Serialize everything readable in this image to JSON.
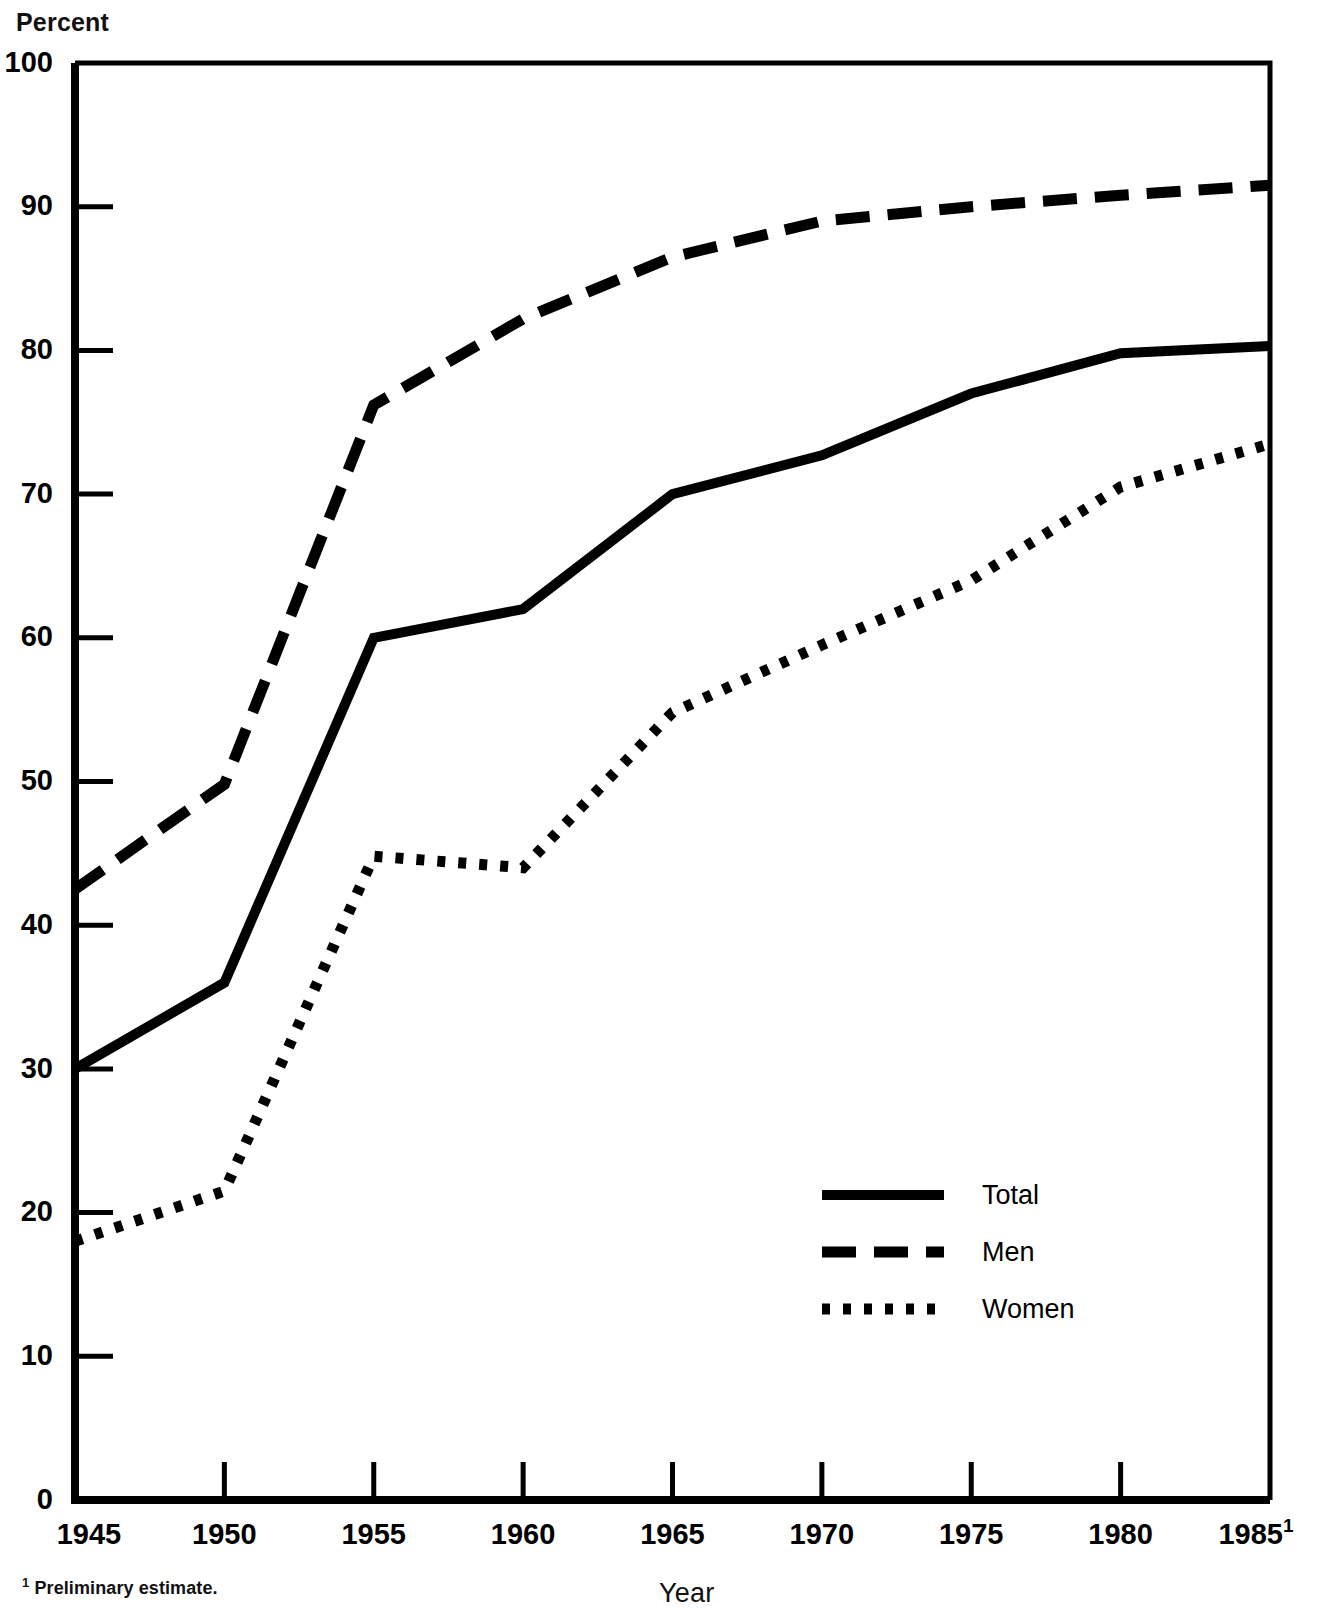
{
  "axes": {
    "ylabel": "Percent",
    "xlabel": "Year",
    "y_ticks": [
      "0",
      "10",
      "20",
      "30",
      "40",
      "50",
      "60",
      "70",
      "80",
      "90",
      "100"
    ],
    "x_ticks": [
      "1945",
      "1950",
      "1955",
      "1960",
      "1965",
      "1970",
      "1975",
      "1980",
      "1985"
    ],
    "x_last_superscript": "1"
  },
  "footnote": {
    "marker": "1",
    "text": " Preliminary estimate."
  },
  "legend": {
    "items": [
      {
        "label": "Total",
        "style": "solid"
      },
      {
        "label": "Men",
        "style": "dashed"
      },
      {
        "label": "Women",
        "style": "dotted"
      }
    ]
  },
  "colors": {
    "line": "#000000",
    "axis": "#000000",
    "background": "#ffffff"
  },
  "chart_data": {
    "type": "line",
    "title": "",
    "xlabel": "Year",
    "ylabel": "Percent",
    "xlim": [
      1945,
      1985
    ],
    "ylim": [
      0,
      100
    ],
    "grid": false,
    "legend_position": "inside-lower-right",
    "x": [
      1945,
      1950,
      1955,
      1960,
      1965,
      1970,
      1975,
      1980,
      1985
    ],
    "series": [
      {
        "name": "Total",
        "style": "solid",
        "values": [
          30.0,
          36.0,
          60.0,
          62.0,
          70.0,
          72.7,
          77.0,
          79.8,
          80.3
        ]
      },
      {
        "name": "Men",
        "style": "dashed",
        "values": [
          42.5,
          49.8,
          76.2,
          82.2,
          86.5,
          89.0,
          90.0,
          90.8,
          91.5
        ]
      },
      {
        "name": "Women",
        "style": "dotted",
        "values": [
          18.0,
          21.5,
          44.8,
          44.0,
          54.8,
          59.5,
          64.0,
          70.5,
          73.5
        ]
      }
    ],
    "notes": [
      "1985 value is a preliminary estimate."
    ]
  }
}
